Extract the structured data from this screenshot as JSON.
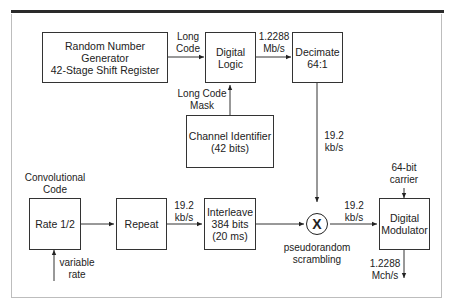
{
  "diagram": {
    "blocks": {
      "rng": "Random Number Generator\n42-Stage Shift Register",
      "digital_logic": "Digital\nLogic",
      "decimate": "Decimate\n64:1",
      "channel_id": "Channel Identifier\n(42 bits)",
      "rate": "Rate 1/2",
      "repeat": "Repeat",
      "interleave": "Interleave\n384 bits\n(20 ms)",
      "multiplier": "X",
      "modulator": "Digital\nModulator"
    },
    "labels": {
      "long_code": "Long\nCode",
      "rate_1": "1.2288\nMb/s",
      "long_code_mask": "Long Code\nMask",
      "rate_2": "19.2\nkb/s",
      "convolutional_code": "Convolutional\nCode",
      "variable_rate": "variable\nrate",
      "rate_3": "19.2\nkb/s",
      "pseudorandom": "pseudorandom\nscrambling",
      "rate_4": "19.2\nkb/s",
      "carrier": "64-bit\ncarrier",
      "output_rate": "1.2288\nMch/s"
    }
  }
}
